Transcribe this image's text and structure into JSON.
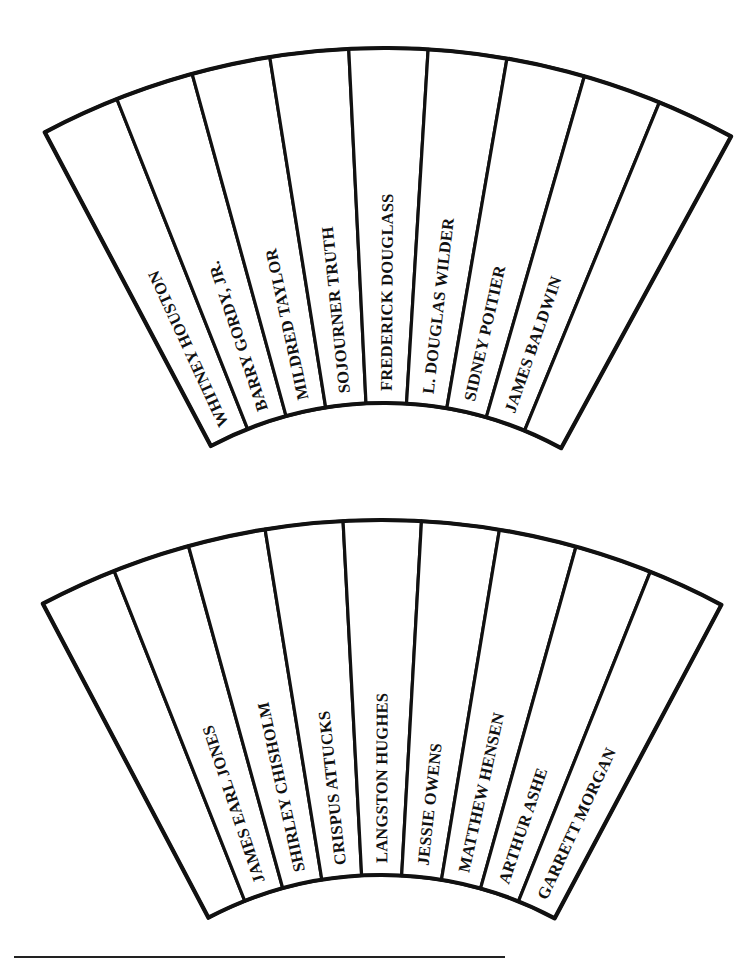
{
  "page": {
    "title": "",
    "background": "#ffffff",
    "ink_color": "#111111"
  },
  "fans": [
    {
      "id": "top-fan",
      "center": [
        384,
        773
      ],
      "outer_radius": 725,
      "inner_radius": 370,
      "start_angle_deg": -27.9,
      "end_angle_deg": 28.6,
      "segments": [
        "WHITNEY HOUSTON",
        "BARRY GORDY, JR.",
        "MILDRED TAYLOR",
        "SOJOURNER TRUTH",
        "FREDERICK DOUGLASS",
        "L. DOUGLAS WILDER",
        "SIDNEY POITIER",
        "JAMES BALDWIN",
        ""
      ]
    },
    {
      "id": "bottom-fan",
      "center": [
        381,
        1245
      ],
      "outer_radius": 725,
      "inner_radius": 370,
      "start_angle_deg": -27.8,
      "end_angle_deg": 28.0,
      "segments": [
        "",
        "JAMES EARL JONES",
        "SHIRLEY CHISHOLM",
        "CRISPUS ATTUCKS",
        "LANGSTON HUGHES",
        "JESSIE OWENS",
        "MATTHEW HENSEN",
        "ARTHUR ASHE",
        "GARRETT MORGAN"
      ]
    }
  ],
  "footer_rule": {
    "x1": 14,
    "x2": 505,
    "y": 957
  }
}
